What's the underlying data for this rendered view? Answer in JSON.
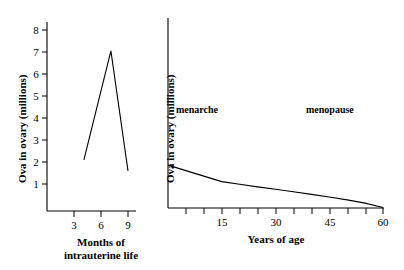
{
  "chart_data": [
    {
      "id": "intrauterine",
      "type": "line",
      "title": "",
      "xlabel": "Months of intrauterine life",
      "ylabel": "Ova in ovary (millions)",
      "xlim": [
        2,
        10
      ],
      "ylim": [
        0,
        8.6
      ],
      "xticks": [
        3,
        6,
        9
      ],
      "xticklabels": [
        "3",
        "6",
        "9"
      ],
      "yticks": [
        1,
        2,
        3,
        4,
        5,
        6,
        7,
        8
      ],
      "yticklabels": [
        "1",
        "2",
        "3",
        "4",
        "5",
        "6",
        "7",
        "8"
      ],
      "grid": false,
      "legend": "none",
      "x": [
        4.1,
        7.1,
        9.0
      ],
      "values": [
        2.1,
        7.05,
        1.6
      ],
      "series": [
        {
          "name": "Ova in ovary",
          "values": [
            2.1,
            7.05,
            1.6
          ]
        }
      ]
    },
    {
      "id": "years-of-age",
      "type": "line",
      "title": "",
      "xlabel": "Years of age",
      "ylabel": "Ova in ovary (millions)",
      "xlim": [
        0,
        62
      ],
      "ylim": [
        0,
        8.6
      ],
      "xticks": [
        5,
        10,
        15,
        20,
        25,
        30,
        35,
        40,
        45,
        50,
        55,
        60
      ],
      "xticklabels": [
        "",
        "",
        "15",
        "",
        "",
        "30",
        "",
        "",
        "45",
        "",
        "",
        "60"
      ],
      "yticks": [],
      "yticklabels": [],
      "grid": false,
      "legend": "none",
      "x": [
        0,
        5,
        10,
        15,
        20,
        25,
        30,
        35,
        40,
        45,
        50,
        55,
        60
      ],
      "values": [
        1.95,
        1.7,
        1.45,
        1.2,
        1.08,
        0.96,
        0.85,
        0.74,
        0.62,
        0.5,
        0.37,
        0.22,
        0.02
      ],
      "series": [
        {
          "name": "Ova in ovary",
          "values": [
            1.95,
            1.7,
            1.45,
            1.2,
            1.08,
            0.96,
            0.85,
            0.74,
            0.62,
            0.5,
            0.37,
            0.22,
            0.02
          ]
        }
      ],
      "annotations": [
        {
          "text": "menarche",
          "x": 12,
          "y": 4.2
        },
        {
          "text": "menopause",
          "x": 48,
          "y": 4.2
        }
      ]
    }
  ],
  "left_chart": {
    "ylabel": "Ova in ovary (millions)",
    "xlabel_line1": "Months of",
    "xlabel_line2": "intrauterine life",
    "ytick_1": "1",
    "ytick_2": "2",
    "ytick_3": "3",
    "ytick_4": "4",
    "ytick_5": "5",
    "ytick_6": "6",
    "ytick_7": "7",
    "ytick_8": "8",
    "xtick_3": "3",
    "xtick_6": "6",
    "xtick_9": "9"
  },
  "right_chart": {
    "ylabel": "Ova in ovary (millions)",
    "xlabel": "Years of age",
    "xtick_15": "15",
    "xtick_30": "30",
    "xtick_45": "45",
    "xtick_60": "60",
    "annotation_menarche": "menarche",
    "annotation_menopause": "menopause"
  },
  "colors": {
    "ink": "#000000",
    "background": "#ffffff"
  }
}
